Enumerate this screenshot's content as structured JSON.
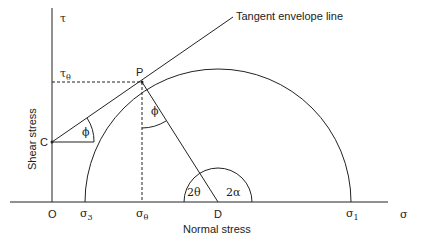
{
  "diagram": {
    "axes": {
      "y_axis_symbol": "τ",
      "x_axis_symbol": "σ",
      "y_axis_label": "Shear stress",
      "x_axis_label": "Normal stress",
      "origin_label": "O"
    },
    "points": {
      "P": "P",
      "C": "C",
      "D": "D"
    },
    "x_ticks": {
      "sigma3": {
        "base": "σ",
        "sub": "3"
      },
      "sigma_theta": {
        "base": "σ",
        "sub": "θ"
      },
      "sigma1": {
        "base": "σ",
        "sub": "1"
      }
    },
    "y_ticks": {
      "tau_theta": {
        "base": "τ",
        "sub": "θ"
      }
    },
    "angles": {
      "phi_at_C": "ϕ",
      "phi_at_P": "ϕ",
      "two_theta": "2θ",
      "two_alpha": "2α"
    },
    "annotation": "Tangent envelope line",
    "colors": {
      "line": "#222222",
      "background": "#ffffff"
    }
  }
}
